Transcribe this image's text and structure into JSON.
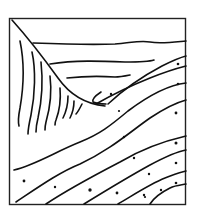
{
  "illustration": {
    "subject": "geological-strata-sketch",
    "stroke_color": "#111111",
    "background_color": "#ffffff",
    "frame": {
      "x": 9,
      "y": 18,
      "width": 177,
      "height": 187
    }
  }
}
